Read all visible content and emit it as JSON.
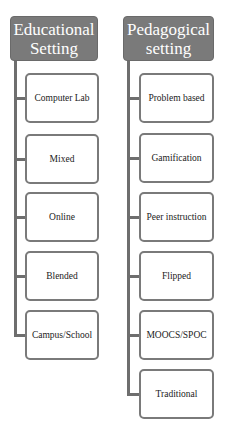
{
  "colors": {
    "header_fill": "#7a7a7a",
    "connector": "#6e6e6e",
    "node_border": "#7a7a7a"
  },
  "columns": [
    {
      "title": "Educational Setting",
      "title_lines": [
        "Educational",
        "Setting"
      ],
      "items": [
        {
          "label": "Computer Lab"
        },
        {
          "label": "Mixed"
        },
        {
          "label": "Online"
        },
        {
          "label": "Blended"
        },
        {
          "label": "Campus/School"
        }
      ]
    },
    {
      "title": "Pedagogical setting",
      "title_lines": [
        "Pedagogical",
        "setting"
      ],
      "items": [
        {
          "label": "Problem based"
        },
        {
          "label": "Gamification"
        },
        {
          "label": "Peer instruction"
        },
        {
          "label": "Flipped"
        },
        {
          "label": "MOOCS/SPOC"
        },
        {
          "label": "Traditional"
        }
      ]
    }
  ]
}
